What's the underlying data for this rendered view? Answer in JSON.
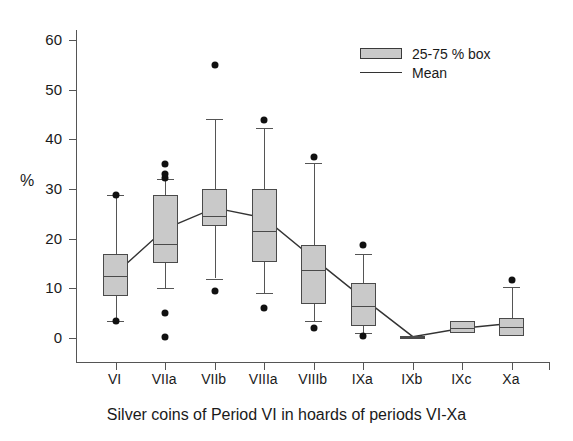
{
  "chart_data": {
    "type": "box",
    "title": "",
    "caption": "Silver coins of Period VI in hoards of periods VI-Xa",
    "xlabel": "Silver coins of Period VI in hoards of periods VI-Xa",
    "ylabel": "%",
    "ylim": [
      -5,
      62
    ],
    "yticks": [
      0,
      10,
      20,
      30,
      40,
      50,
      60
    ],
    "ytick_labels": [
      "0",
      "10",
      "20",
      "30",
      "40",
      "50",
      "60"
    ],
    "grid": false,
    "legend": {
      "position": "top-right",
      "entries": [
        {
          "label": "25-75 % box",
          "marker": "box",
          "color": "#c9c9c9"
        },
        {
          "label": "Mean",
          "marker": "line",
          "color": "#333333"
        }
      ]
    },
    "categories": [
      "VI",
      "VIIa",
      "VIIb",
      "VIIIa",
      "VIIIb",
      "IXa",
      "IXb",
      "IXc",
      "Xa"
    ],
    "boxes": [
      {
        "category": "VI",
        "whisker_low": 3.5,
        "q1": 8.5,
        "median": 12.5,
        "q3": 17.0,
        "whisker_high": 28.8,
        "mean": 13.0,
        "outliers": [
          3.5,
          28.8
        ]
      },
      {
        "category": "VIIa",
        "whisker_low": 10.0,
        "q1": 15.2,
        "median": 19.0,
        "q3": 28.8,
        "whisker_high": 32.0,
        "mean": 22.0,
        "outliers": [
          0.2,
          5.0,
          32.2,
          33.0,
          35.0
        ]
      },
      {
        "category": "VIIb",
        "whisker_low": 12.0,
        "q1": 22.5,
        "median": 24.5,
        "q3": 30.0,
        "whisker_high": 44.0,
        "mean": 26.2,
        "outliers": [
          9.5,
          55.0
        ]
      },
      {
        "category": "VIIIa",
        "whisker_low": 9.0,
        "q1": 15.3,
        "median": 21.5,
        "q3": 30.0,
        "whisker_high": 42.3,
        "mean": 24.2,
        "outliers": [
          6.0,
          43.8
        ]
      },
      {
        "category": "VIIIb",
        "whisker_low": 3.5,
        "q1": 6.8,
        "median": 13.8,
        "q3": 18.8,
        "whisker_high": 35.3,
        "mean": 16.0,
        "outliers": [
          2.0,
          36.5
        ]
      },
      {
        "category": "IXa",
        "whisker_low": 1.0,
        "q1": 2.5,
        "median": 6.5,
        "q3": 11.0,
        "whisker_high": 17.0,
        "mean": 8.0,
        "outliers": [
          0.5,
          18.8
        ]
      },
      {
        "category": "IXb",
        "whisker_low": 0.0,
        "q1": 0.0,
        "median": 0.2,
        "q3": 0.4,
        "whisker_high": 0.4,
        "mean": 0.3,
        "outliers": []
      },
      {
        "category": "IXc",
        "whisker_low": 1.0,
        "q1": 1.0,
        "median": 2.0,
        "q3": 3.4,
        "whisker_high": 3.4,
        "mean": 2.0,
        "outliers": []
      },
      {
        "category": "Xa",
        "whisker_low": 0.5,
        "q1": 0.5,
        "median": 2.3,
        "q3": 4.0,
        "whisker_high": 10.2,
        "mean": 3.0,
        "outliers": [
          11.8
        ]
      }
    ],
    "mean_series": {
      "name": "Mean",
      "values": [
        13.0,
        22.0,
        26.2,
        24.2,
        16.0,
        8.0,
        0.3,
        2.0,
        3.0
      ]
    }
  }
}
